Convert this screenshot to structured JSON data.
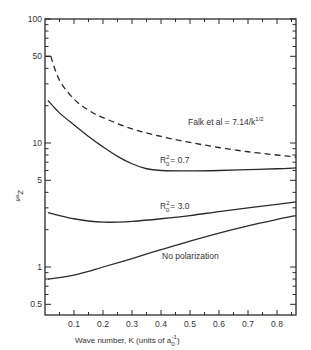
{
  "chart_data": {
    "type": "line",
    "title": "",
    "xlabel": "Wave number, K (units of a₀⁻¹)",
    "ylabel": "Z_eff",
    "xlim": [
      0,
      0.866
    ],
    "ylim": [
      0.4,
      100
    ],
    "yscale": "log",
    "grid": false,
    "x_ticks": [
      0.1,
      0.2,
      0.3,
      0.4,
      0.5,
      0.6,
      0.7,
      0.8
    ],
    "x_tick_labels": [
      "0.1",
      "0.2",
      "0.3",
      "0.4",
      "0.5",
      "0.6",
      "0.7",
      "0.8"
    ],
    "y_ticks": [
      0.5,
      1,
      5,
      10,
      50,
      100
    ],
    "y_tick_labels": [
      "0.5",
      "1",
      "5",
      "10",
      "50",
      "100"
    ],
    "series": [
      {
        "name": "Falk et al = 7.14/k^1/2",
        "style": "dashed",
        "x": [
          0.02,
          0.05,
          0.1,
          0.15,
          0.2,
          0.3,
          0.4,
          0.5,
          0.6,
          0.7,
          0.8,
          0.866
        ],
        "values": [
          50,
          32,
          22.6,
          18.4,
          16,
          13,
          11.3,
          10.1,
          9.2,
          8.5,
          8.0,
          7.7
        ]
      },
      {
        "name": "R0^2 = 0.7",
        "style": "solid",
        "x": [
          0.01,
          0.05,
          0.1,
          0.15,
          0.2,
          0.25,
          0.3,
          0.35,
          0.4,
          0.5,
          0.6,
          0.7,
          0.8,
          0.866
        ],
        "values": [
          22,
          17.5,
          14,
          11.3,
          9.3,
          7.8,
          6.8,
          6.2,
          6.0,
          5.95,
          6.0,
          6.1,
          6.2,
          6.3
        ]
      },
      {
        "name": "R0^2 = 3.0",
        "style": "solid",
        "x": [
          0.01,
          0.05,
          0.1,
          0.15,
          0.2,
          0.25,
          0.3,
          0.4,
          0.5,
          0.6,
          0.7,
          0.8,
          0.866
        ],
        "values": [
          2.75,
          2.6,
          2.45,
          2.35,
          2.3,
          2.3,
          2.33,
          2.45,
          2.6,
          2.8,
          3.0,
          3.2,
          3.35
        ]
      },
      {
        "name": "No polarization",
        "style": "solid",
        "x": [
          0.01,
          0.05,
          0.1,
          0.15,
          0.2,
          0.3,
          0.4,
          0.5,
          0.6,
          0.7,
          0.8,
          0.866
        ],
        "values": [
          0.8,
          0.82,
          0.86,
          0.92,
          1.0,
          1.17,
          1.38,
          1.62,
          1.88,
          2.15,
          2.42,
          2.6
        ]
      }
    ],
    "annotations": [
      {
        "text": "Falk et al = 7.14/k^1/2",
        "near_series": "Falk et al = 7.14/k^1/2"
      },
      {
        "text": "R0^2 = 0.7",
        "near_series": "R0^2 = 0.7"
      },
      {
        "text": "R0^2 = 3.0",
        "near_series": "R0^2 = 3.0"
      },
      {
        "text": "No polarization",
        "near_series": "No polarization"
      }
    ]
  },
  "labels": {
    "ylabel_main": "Z",
    "ylabel_sub": "eff",
    "xlabel_main": "Wave number, K (units of a",
    "xlabel_sub": "0",
    "xlabel_sup": "-1",
    "xlabel_end": ")",
    "falk_main": "Falk et al = 7.14/k",
    "falk_sup": "1/2",
    "r07_R": "R",
    "r07_sup": "2",
    "r07_sub": "0",
    "r07_val": "= 0.7",
    "r30_R": "R",
    "r30_sup": "2",
    "r30_sub": "0",
    "r30_val": "= 3.0",
    "nopol": "No polarization"
  },
  "colors": {
    "ink": "#2a2a2a",
    "background": "#ffffff"
  }
}
